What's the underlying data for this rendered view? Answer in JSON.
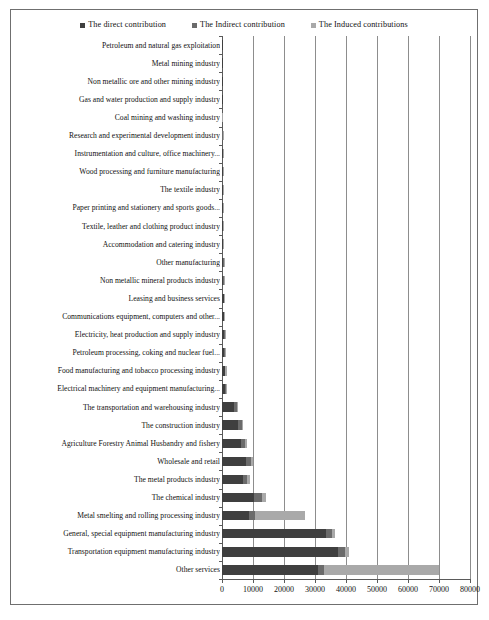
{
  "chart_data": {
    "type": "bar",
    "orientation": "horizontal",
    "stacked": true,
    "title": "",
    "subtitle": "",
    "xlabel": "",
    "ylabel": "",
    "xlim": [
      0,
      80000
    ],
    "ylim": null,
    "grid": true,
    "grid_axis": "x",
    "legend_position": "top-center",
    "xticks": [
      0,
      10000,
      20000,
      30000,
      40000,
      50000,
      60000,
      70000,
      80000
    ],
    "xtick_labels": [
      "0",
      "10000",
      "20000",
      "30000",
      "40000",
      "50000",
      "60000",
      "70000",
      "80000"
    ],
    "colors": {
      "direct": "#3f3f3f",
      "indirect": "#6b6b6b",
      "induced": "#a9a9a9",
      "gridline": "#8d8d8d",
      "axis": "#5a5a5a",
      "frame": "#6f6f6f",
      "background": "#ffffff"
    },
    "legend": [
      {
        "label": "The direct contribution",
        "color": "#3f3f3f",
        "key": "direct"
      },
      {
        "label": "The Indirect contribution",
        "color": "#6b6b6b",
        "key": "indirect"
      },
      {
        "label": "The Induced contributions",
        "color": "#a9a9a9",
        "key": "induced"
      }
    ],
    "categories": [
      "Petroleum and natural gas exploitation",
      "Metal mining industry",
      "Non metallic ore and other mining industry",
      "Gas and water production and supply industry",
      "Coal mining and washing industry",
      "Research and experimental development industry",
      "Instrumentation and culture, office machinery...",
      "Wood processing and furniture manufacturing",
      "The textile industry",
      "Paper printing and stationery and sports goods...",
      "Textile, leather and clothing product industry",
      "Accommodation and catering industry",
      "Other manufacturing",
      "Non metallic mineral products industry",
      "Leasing and business services",
      "Communications equipment, computers and other...",
      "Electricity, heat production and supply industry",
      "Petroleum processing, coking and nuclear fuel...",
      "Food manufacturing and tobacco processing industry",
      "Electrical machinery and equipment manufacturing...",
      "The transportation and warehousing industry",
      "The construction industry",
      "Agriculture Forestry Animal Husbandry and fishery",
      "Wholesale and retail",
      "The metal products industry",
      "The chemical industry",
      "Metal smelting and rolling processing industry",
      "General, special equipment manufacturing industry",
      "Transportation equipment manufacturing industry",
      "Other services"
    ],
    "series": [
      {
        "name": "The direct contribution",
        "key": "direct",
        "color": "#3f3f3f",
        "values": [
          40,
          60,
          80,
          110,
          130,
          160,
          180,
          200,
          230,
          260,
          290,
          330,
          380,
          430,
          500,
          560,
          640,
          720,
          820,
          900,
          3800,
          5200,
          6200,
          7800,
          6800,
          10200,
          8600,
          33500,
          37500,
          31000
        ]
      },
      {
        "name": "The Indirect contribution",
        "key": "indirect",
        "color": "#6b6b6b",
        "values": [
          10,
          15,
          20,
          25,
          30,
          40,
          50,
          60,
          70,
          80,
          90,
          110,
          120,
          140,
          170,
          200,
          230,
          260,
          300,
          340,
          900,
          1100,
          1300,
          1500,
          1400,
          2600,
          2200,
          1900,
          2300,
          1800
        ]
      },
      {
        "name": "The Induced contributions",
        "key": "induced",
        "color": "#a9a9a9",
        "values": [
          5,
          8,
          12,
          15,
          20,
          28,
          35,
          45,
          55,
          65,
          75,
          90,
          100,
          130,
          160,
          220,
          260,
          300,
          340,
          420,
          450,
          480,
          520,
          560,
          700,
          1400,
          16000,
          1100,
          1300,
          37200
        ]
      }
    ],
    "totals": [
      55,
      83,
      112,
      150,
      180,
      228,
      265,
      305,
      355,
      405,
      455,
      530,
      600,
      700,
      830,
      980,
      1130,
      1280,
      1460,
      1660,
      5150,
      6780,
      8020,
      9860,
      8900,
      14200,
      26800,
      36500,
      41100,
      70000
    ]
  }
}
